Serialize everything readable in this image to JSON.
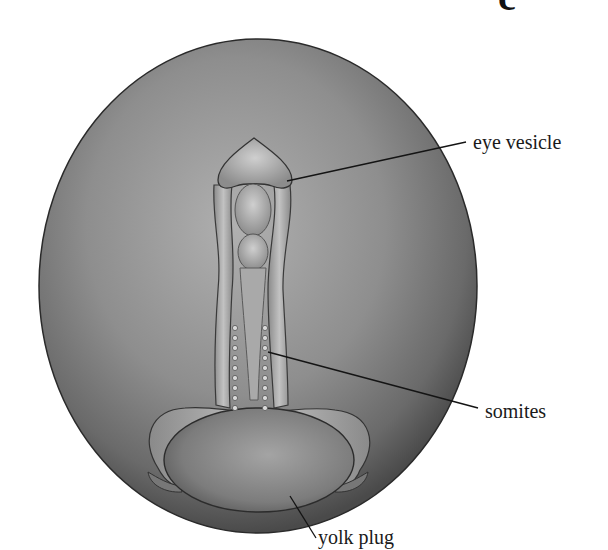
{
  "figure": {
    "panel_label": "c",
    "labels": {
      "eye_vesicle": "eye vesicle",
      "somites": "somites",
      "yolk_plug": "yolk plug"
    },
    "colors": {
      "embryo_dark": "#5a5a5a",
      "embryo_light": "#a8a8a8",
      "outline": "#2a2a2a",
      "label_text": "#1a1a1a"
    }
  }
}
